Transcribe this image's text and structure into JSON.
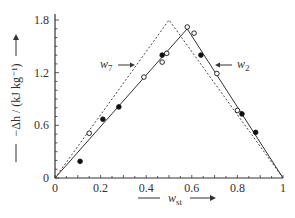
{
  "chart_data": {
    "type": "scatter",
    "title": "",
    "xlabel": "w_st",
    "ylabel": "−Δh / (kJ kg⁻¹)",
    "xlim": [
      0,
      1
    ],
    "ylim": [
      0,
      1.8
    ],
    "x_ticks": [
      "0",
      "0.2",
      "0.4",
      "0.6",
      "0.8",
      "1"
    ],
    "y_ticks": [
      "0",
      "0.6",
      "1.2",
      "1.8"
    ],
    "grid": false,
    "annotations": [
      {
        "text": "w7",
        "subscript": "7",
        "base": "w",
        "arrow": "right",
        "x": 0.31,
        "y": 1.2
      },
      {
        "text": "w2",
        "subscript": "2",
        "base": "w",
        "arrow": "left",
        "x": 0.78,
        "y": 1.2
      }
    ],
    "series": [
      {
        "name": "filled",
        "marker": "filled-circle",
        "points": [
          [
            0.11,
            0.19
          ],
          [
            0.21,
            0.67
          ],
          [
            0.28,
            0.81
          ],
          [
            0.47,
            1.4
          ],
          [
            0.64,
            1.4
          ],
          [
            0.82,
            0.73
          ],
          [
            0.88,
            0.52
          ]
        ]
      },
      {
        "name": "open",
        "marker": "open-circle",
        "points": [
          [
            0.15,
            0.51
          ],
          [
            0.39,
            1.15
          ],
          [
            0.47,
            1.32
          ],
          [
            0.49,
            1.42
          ],
          [
            0.58,
            1.72
          ],
          [
            0.61,
            1.65
          ],
          [
            0.71,
            1.19
          ],
          [
            0.8,
            0.77
          ]
        ]
      },
      {
        "name": "solid-fit",
        "style": "solid-line",
        "points": [
          [
            0,
            0
          ],
          [
            0.58,
            1.7
          ],
          [
            1,
            0
          ]
        ]
      },
      {
        "name": "dashed-ideal",
        "style": "dashed-line",
        "points": [
          [
            0,
            0
          ],
          [
            0.5,
            1.8
          ],
          [
            1,
            0
          ]
        ]
      }
    ]
  },
  "labels": {
    "x_axis": "w",
    "x_axis_sub": "st",
    "y_axis": "−Δh / (kJ kg⁻¹)",
    "ann_w7_base": "w",
    "ann_w7_sub": "7",
    "ann_w2_base": "w",
    "ann_w2_sub": "2"
  }
}
